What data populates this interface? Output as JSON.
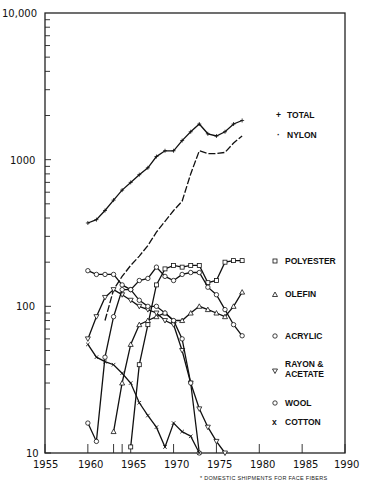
{
  "chart_data": {
    "type": "line",
    "title": "",
    "xlabel": "",
    "ylabel": "",
    "yscale": "log",
    "xlim": [
      1955,
      1990
    ],
    "ylim": [
      10,
      10000
    ],
    "x_ticks": [
      "1955",
      "1960",
      "1965",
      "1970",
      "1975",
      "1980",
      "1985",
      "1990"
    ],
    "y_ticks": [
      "10",
      "100",
      "1000",
      "10,000"
    ],
    "grid": false,
    "footnote": "* DOMESTIC SHIPMENTS FOR FACE FIBERS",
    "legend_position": "right, inside plot",
    "series": [
      {
        "name": "TOTAL",
        "marker": "+",
        "style": "solid",
        "x": [
          1960,
          1961,
          1962,
          1963,
          1964,
          1965,
          1966,
          1967,
          1968,
          1969,
          1970,
          1971,
          1972,
          1973,
          1974,
          1975,
          1976,
          1977,
          1978
        ],
        "values": [
          370,
          390,
          450,
          530,
          620,
          700,
          790,
          880,
          1050,
          1150,
          1150,
          1350,
          1550,
          1750,
          1500,
          1450,
          1550,
          1750,
          1850
        ]
      },
      {
        "name": "NYLON",
        "marker": "·",
        "style": "dashed",
        "x": [
          1962,
          1963,
          1964,
          1965,
          1966,
          1967,
          1968,
          1969,
          1970,
          1971,
          1972,
          1973,
          1974,
          1975,
          1976,
          1977,
          1978
        ],
        "values": [
          80,
          130,
          160,
          190,
          220,
          260,
          320,
          380,
          450,
          520,
          800,
          1150,
          1100,
          1100,
          1120,
          1300,
          1450
        ]
      },
      {
        "name": "POLYESTER",
        "marker": "square",
        "style": "solid",
        "x": [
          1965,
          1966,
          1967,
          1968,
          1969,
          1970,
          1971,
          1972,
          1973,
          1974,
          1975,
          1976,
          1977,
          1978
        ],
        "values": [
          11,
          40,
          75,
          140,
          180,
          190,
          185,
          190,
          190,
          145,
          150,
          200,
          205,
          205
        ]
      },
      {
        "name": "OLEFIN",
        "marker": "triangle-up",
        "style": "solid",
        "x": [
          1963,
          1964,
          1965,
          1966,
          1967,
          1968,
          1969,
          1970,
          1971,
          1972,
          1973,
          1974,
          1975,
          1976,
          1977,
          1978
        ],
        "values": [
          14,
          30,
          55,
          75,
          80,
          85,
          90,
          80,
          80,
          90,
          100,
          95,
          90,
          85,
          100,
          125
        ]
      },
      {
        "name": "ACRYLIC",
        "marker": "circle",
        "style": "solid",
        "x": [
          1960,
          1961,
          1962,
          1963,
          1964,
          1965,
          1966,
          1967,
          1968,
          1969,
          1970,
          1971,
          1972,
          1973,
          1974,
          1975,
          1976,
          1977,
          1978
        ],
        "values": [
          175,
          165,
          165,
          165,
          140,
          130,
          150,
          155,
          185,
          160,
          150,
          165,
          170,
          170,
          135,
          120,
          95,
          75,
          63
        ]
      },
      {
        "name": "RAYON & ACETATE",
        "marker": "triangle-down",
        "style": "solid",
        "x": [
          1960,
          1961,
          1962,
          1963,
          1964,
          1965,
          1966,
          1967,
          1968,
          1969,
          1970,
          1971,
          1972,
          1973,
          1974,
          1975,
          1976
        ],
        "values": [
          60,
          85,
          115,
          130,
          120,
          110,
          100,
          95,
          90,
          80,
          75,
          50,
          30,
          20,
          15,
          12,
          10
        ]
      },
      {
        "name": "WOOL",
        "marker": "circle",
        "style": "solid",
        "x": [
          1960,
          1961,
          1962,
          1963,
          1964,
          1965,
          1966,
          1967,
          1968,
          1969,
          1970,
          1971,
          1972,
          1973
        ],
        "values": [
          16,
          12,
          45,
          85,
          130,
          130,
          110,
          100,
          100,
          90,
          80,
          60,
          30,
          10
        ]
      },
      {
        "name": "COTTON",
        "marker": "x",
        "style": "solid",
        "x": [
          1960,
          1961,
          1962,
          1963,
          1964,
          1965,
          1966,
          1967,
          1968,
          1969,
          1970,
          1971,
          1972,
          1973
        ],
        "values": [
          55,
          45,
          42,
          40,
          35,
          30,
          22,
          18,
          15,
          11,
          16,
          14,
          13,
          10
        ]
      }
    ]
  },
  "legend": {
    "total": "TOTAL",
    "nylon": "NYLON",
    "polyester": "POLYESTER",
    "olefin": "OLEFIN",
    "acrylic": "ACRYLIC",
    "rayon_1": "RAYON &",
    "rayon_2": "ACETATE",
    "wool": "WOOL",
    "cotton": "COTTON"
  },
  "axis": {
    "y": [
      "10,000",
      "1000",
      "100",
      "10"
    ],
    "x": [
      "1955",
      "1960",
      "1965",
      "1970",
      "1975",
      "1980",
      "1985",
      "1990"
    ]
  },
  "footnote": "* DOMESTIC SHIPMENTS FOR FACE FIBERS"
}
